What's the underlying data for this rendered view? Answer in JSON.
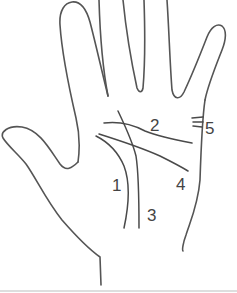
{
  "diagram": {
    "labels": [
      {
        "id": "1",
        "text": "1",
        "target": "curved line around thumb base"
      },
      {
        "id": "2",
        "text": "2",
        "target": "upper horizontal line"
      },
      {
        "id": "3",
        "text": "3",
        "target": "vertical line through center of palm"
      },
      {
        "id": "4",
        "text": "4",
        "target": "diagonal line across palm"
      },
      {
        "id": "5",
        "text": "5",
        "target": "short marks on edge of palm below little finger"
      }
    ],
    "colors": {
      "line": "#555555",
      "background": "#ffffff",
      "text": "#444444"
    }
  }
}
